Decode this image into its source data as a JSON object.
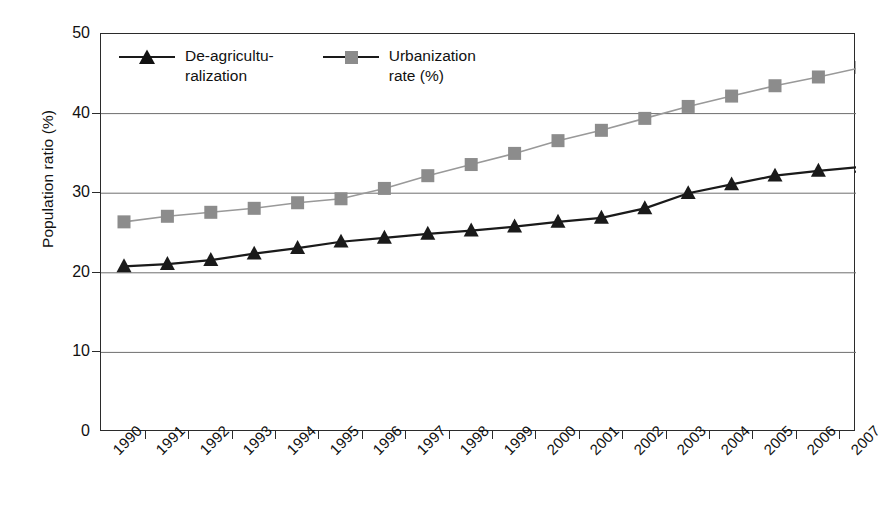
{
  "chart_data": {
    "type": "line",
    "title": "",
    "xlabel": "",
    "ylabel": "Population ratio (%)",
    "ylim": [
      0,
      50
    ],
    "yticks": [
      0,
      10,
      20,
      30,
      40,
      50
    ],
    "ytick_labels": [
      "0",
      "10",
      "20",
      "30",
      "40",
      "50"
    ],
    "grid": "horizontal",
    "legend_position": "top-left inside plot",
    "categories": [
      "1990",
      "1991",
      "1992",
      "1993",
      "1994",
      "1995",
      "1996",
      "1997",
      "1998",
      "1999",
      "2000",
      "2001",
      "2002",
      "2003",
      "2004",
      "2005",
      "2006",
      "2007"
    ],
    "series": [
      {
        "name": "De-agriculturalization",
        "legend_label": "De-agricultu-\nralization",
        "marker": "triangle",
        "color": "#1a1a1a",
        "line_color": "#1a1a1a",
        "values": [
          20.8,
          21.1,
          21.6,
          22.4,
          23.1,
          23.9,
          24.4,
          24.9,
          25.3,
          25.8,
          26.4,
          26.9,
          28.1,
          30.0,
          31.1,
          32.2,
          32.8,
          33.3
        ]
      },
      {
        "name": "Urbanization rate (%)",
        "legend_label": "Urbanization\nrate (%)",
        "marker": "square",
        "color": "#8c8c8c",
        "line_color": "#999999",
        "values": [
          26.4,
          27.1,
          27.6,
          28.1,
          28.8,
          29.3,
          30.6,
          32.2,
          33.6,
          35.0,
          36.6,
          37.9,
          39.4,
          40.9,
          42.2,
          43.5,
          44.6,
          45.8
        ]
      }
    ]
  },
  "axes": {
    "y_title": "Population ratio (%)"
  },
  "legend": {
    "entries": [
      {
        "label": "De-agricultu-\nralization",
        "marker": "triangle-marker-icon"
      },
      {
        "label": "Urbanization\nrate (%)",
        "marker": "square-marker-icon"
      }
    ]
  },
  "colors": {
    "series_dark": "#1a1a1a",
    "series_gray": "#8c8c8c",
    "grid": "#6e6e6e",
    "frame": "#2b2b2b",
    "background": "#ffffff"
  }
}
